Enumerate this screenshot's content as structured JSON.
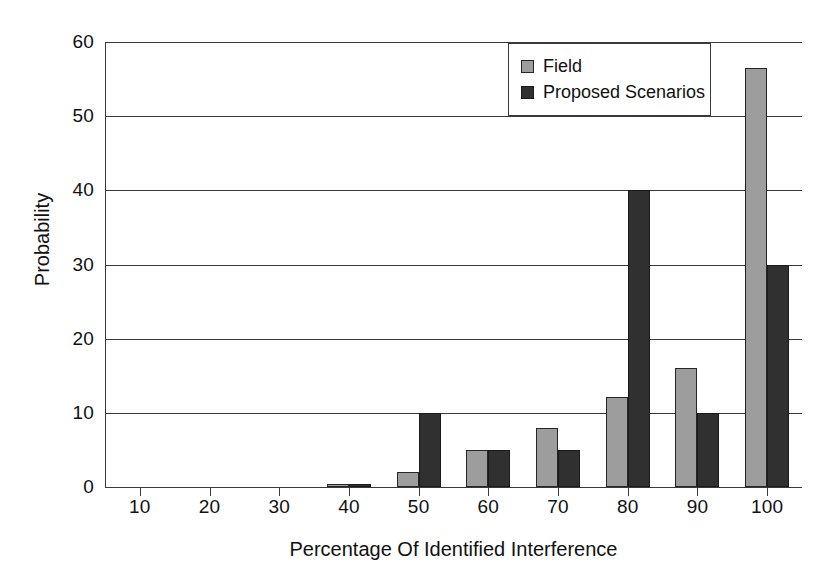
{
  "chart_data": {
    "type": "bar",
    "title": "",
    "subtitle": "",
    "xlabel": "Percentage Of Identified Interference",
    "ylabel": "Probability",
    "categories": [
      "10",
      "20",
      "30",
      "40",
      "50",
      "60",
      "70",
      "80",
      "90",
      "100"
    ],
    "series": [
      {
        "name": "Field",
        "color": "#9d9d9d",
        "values": [
          0,
          0,
          0,
          0.4,
          2,
          5,
          8,
          12.2,
          16,
          56.5
        ]
      },
      {
        "name": "Proposed Scenarios",
        "color": "#303030",
        "values": [
          0,
          0,
          0,
          0.4,
          10,
          5,
          5,
          40,
          10,
          30
        ]
      }
    ],
    "ylim": [
      0,
      60
    ],
    "y_ticks": [
      0,
      10,
      20,
      30,
      40,
      50,
      60
    ],
    "y_tick_labels": [
      "0",
      "10",
      "20",
      "30",
      "40",
      "50",
      "60"
    ],
    "grid": "horizontal",
    "legend_position": "top-right",
    "legend_entries": [
      "Field",
      "Proposed Scenarios"
    ]
  }
}
